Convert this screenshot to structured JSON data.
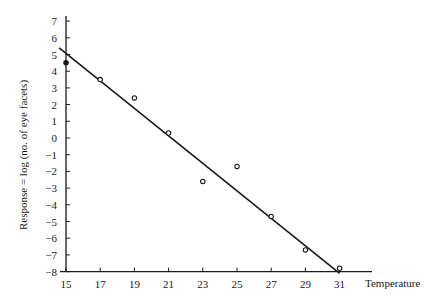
{
  "chart_data": {
    "type": "scatter",
    "title": "",
    "xlabel": "Temperature",
    "ylabel": "Response = log (no. of eye facets)",
    "xlim": [
      15,
      31
    ],
    "ylim": [
      -8,
      7
    ],
    "grid": false,
    "x_ticks": [
      15,
      17,
      19,
      21,
      23,
      25,
      27,
      29,
      31
    ],
    "y_ticks": [
      7,
      6,
      5,
      4,
      3,
      2,
      1,
      0,
      -1,
      -2,
      -3,
      -4,
      -5,
      -6,
      -7,
      -8
    ],
    "series": [
      {
        "name": "observations",
        "marker": "open-circle",
        "x": [
          15,
          17,
          19,
          21,
          23,
          25,
          27,
          29,
          31
        ],
        "y": [
          4.5,
          3.5,
          2.4,
          0.3,
          -2.6,
          -1.7,
          -4.7,
          -6.7,
          -7.8
        ]
      }
    ],
    "fit_line": {
      "name": "fitted regression line",
      "x": [
        14.6,
        31
      ],
      "y": [
        5.4,
        -8.1
      ]
    }
  },
  "labels": {
    "x_axis_title": "Temperature",
    "y_axis_title": "Response = log (no. of eye facets)"
  },
  "colors": {
    "ink": "#1a1a1a",
    "background": "#ffffff"
  }
}
